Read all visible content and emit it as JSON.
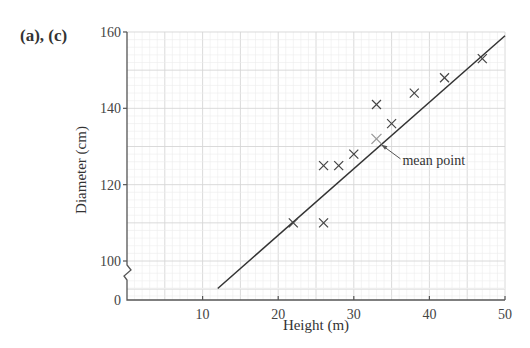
{
  "figure": {
    "part_label": "(a), (c)",
    "annotation": "mean point"
  },
  "chart_data": {
    "type": "scatter",
    "title": "",
    "xlabel": "Height (m)",
    "ylabel": "Diameter (cm)",
    "xlim": [
      0,
      50
    ],
    "ylim": [
      0,
      160
    ],
    "y_axis_break": "between 0 and 100",
    "x_ticks": [
      10,
      20,
      30,
      40,
      50
    ],
    "y_ticks": [
      0,
      100,
      120,
      140,
      160
    ],
    "x_origin_label": "0",
    "grid": true,
    "series": [
      {
        "name": "data points",
        "marker": "x",
        "x": [
          22,
          26,
          26,
          28,
          30,
          33,
          35,
          38,
          42,
          47
        ],
        "y": [
          110,
          110,
          125,
          125,
          128,
          141,
          136,
          144,
          148,
          153
        ]
      },
      {
        "name": "mean point",
        "marker": "+",
        "x": [
          33
        ],
        "y": [
          132
        ]
      },
      {
        "name": "line of best fit",
        "type": "line",
        "x": [
          12,
          50
        ],
        "y": [
          96,
          159
        ]
      }
    ],
    "annotations": [
      {
        "text": "mean point",
        "x": 33,
        "y": 132
      }
    ]
  }
}
